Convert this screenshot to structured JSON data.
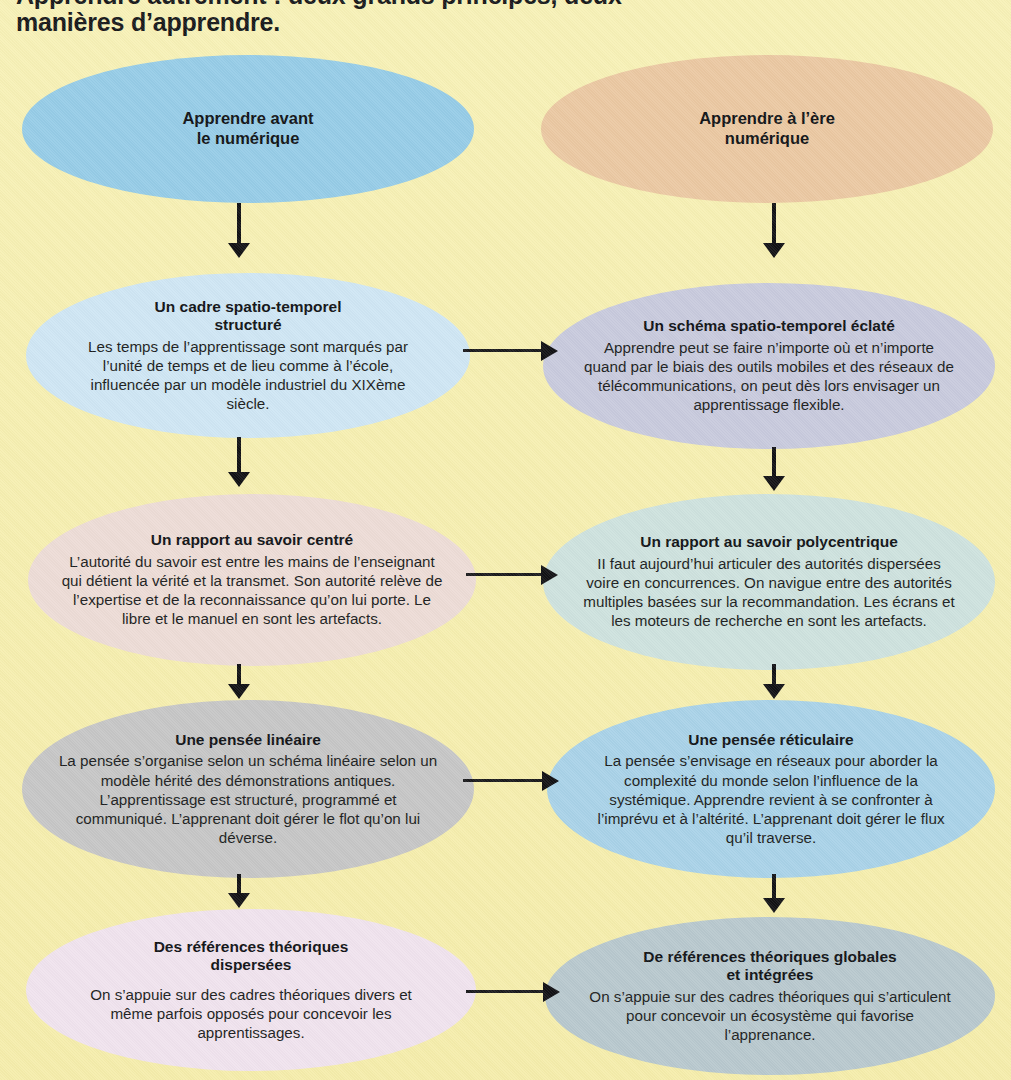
{
  "heading": {
    "line_top_partial": "Apprendre autrement : deux grands principes, deux",
    "line_visible": "manières d’apprendre."
  },
  "diagram": {
    "type": "two-column-flow",
    "background_color": "#f6f0b4",
    "columns": [
      {
        "id": "avant",
        "header": "Apprendre avant\nle numérique"
      },
      {
        "id": "ere",
        "header": "Apprendre à l’ère\nnumérique"
      }
    ],
    "nodes": {
      "left_header": {
        "title_line1": "Apprendre avant",
        "title_line2": "le numérique",
        "color": "#96cce7"
      },
      "right_header": {
        "title_line1": "Apprendre à l’ère",
        "title_line2": "numérique",
        "color": "#ebc8a2"
      },
      "left_1": {
        "title_line1": "Un cadre spatio-temporel",
        "title_line2": "structuré",
        "body": "Les temps de l’apprentissage sont marqués par l’unité de temps et de lieu comme à l’école, influencée par un modèle industriel du XIXème siècle.",
        "color": "#cfe6f4"
      },
      "right_1": {
        "title_line1": "Un schéma spatio-temporel éclaté",
        "title_line2": "",
        "body": "Apprendre peut se faire n’importe où et n’importe quand par le biais des outils mobiles et des réseaux de télécommunications, on peut dès lors envisager un apprentissage flexible.",
        "color": "#c8cadd"
      },
      "left_2": {
        "title_line1": "Un rapport au savoir centré",
        "title_line2": "",
        "body": "L’autorité du savoir est entre les mains de l’enseignant qui détient la vérité et la transmet. Son autorité relève de l’expertise et de la reconnaissance qu’on lui porte. Le libre et le manuel en sont les artefacts.",
        "color": "#eddcd6"
      },
      "right_2": {
        "title_line1": "Un rapport au savoir polycentrique",
        "title_line2": "",
        "body": "II faut aujourd’hui articuler des autorités dispersées voire en concurrences. On navigue entre des autorités multiples basées sur la recommandation. Les écrans et les moteurs de recherche en sont les artefacts.",
        "color": "#cee2de"
      },
      "left_3": {
        "title_line1": "Une pensée linéaire",
        "title_line2": "",
        "body": "La pensée s’organise selon un schéma linéaire selon un modèle hérité des démonstrations antiques. L’apprentissage est structuré, programmé et communiqué. L’apprenant doit gérer le flot qu’on lui déverse.",
        "color": "#c6c6c6"
      },
      "right_3": {
        "title_line1": "Une pensée réticulaire",
        "title_line2": "",
        "body": "La pensée s’envisage en réseaux pour aborder la complexité du monde selon l’influence de la systémique. Apprendre revient à se confronter à l’imprévu et à l’altérité. L’apprenant doit gérer le flux qu’il traverse.",
        "color": "#a9d2e8"
      },
      "left_4": {
        "title_line1": "Des références théoriques",
        "title_line2": "dispersées",
        "body": "On s’appuie sur des cadres théoriques divers et même parfois opposés pour concevoir les apprentissages.",
        "color": "#f0e3ee"
      },
      "right_4": {
        "title_line1": "De références théoriques globales",
        "title_line2": "et intégrées",
        "body": "On s’appuie sur des cadres théoriques qui s’articulent pour concevoir un écosystème qui favorise l’apprenance.",
        "color": "#b8c8ce"
      }
    },
    "connectors": {
      "vertical_count": 8,
      "horizontal_count": 4,
      "arrow_color": "#111114",
      "description": "Each column flows top-to-bottom with 4 downward arrows; 4 horizontal arrows link the left column rows to the right column rows."
    }
  }
}
